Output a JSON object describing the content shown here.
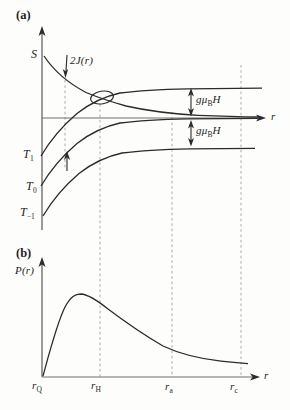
{
  "figure": {
    "background": "#fdfdfc",
    "colors": {
      "curve": "#2b2b2b",
      "axis": "#4a4a4a",
      "dashed": "#a9a9a9",
      "text": "#1f1f1f"
    },
    "panel_a": {
      "tag": "(a)",
      "singlet_label": "S",
      "exchange_label": "2J(r)",
      "triplet_up": {
        "base": "T",
        "sub": "1"
      },
      "triplet_zero": {
        "base": "T",
        "sub": "0"
      },
      "triplet_down": {
        "base": "T",
        "sub": "−1"
      },
      "zeeman_upper": {
        "pre": "gμ",
        "sub": "B",
        "post": "H"
      },
      "zeeman_lower": {
        "pre": "gμ",
        "sub": "B",
        "post": "H"
      },
      "x_axis_label": "r"
    },
    "panel_b": {
      "tag": "(b)",
      "y_axis_label": "P(r)",
      "x_axis_label": "r",
      "ticks": {
        "rQ": {
          "base": "r",
          "sub": "Q"
        },
        "rH": {
          "base": "r",
          "sub": "H"
        },
        "ra": {
          "base": "r",
          "sub": "a"
        },
        "rc": {
          "base": "r",
          "sub": "c"
        }
      }
    }
  }
}
